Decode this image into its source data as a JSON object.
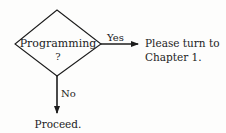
{
  "flowchart": {
    "decision": {
      "label_line1": "Programming",
      "label_line2": "?"
    },
    "yes_branch": {
      "label": "Yes",
      "target_line1": "Please turn to",
      "target_line2": "Chapter 1."
    },
    "no_branch": {
      "label": "No",
      "target": "Proceed."
    },
    "colors": {
      "ink": "#1c1c1c",
      "paper": "#fdfdfc"
    }
  }
}
